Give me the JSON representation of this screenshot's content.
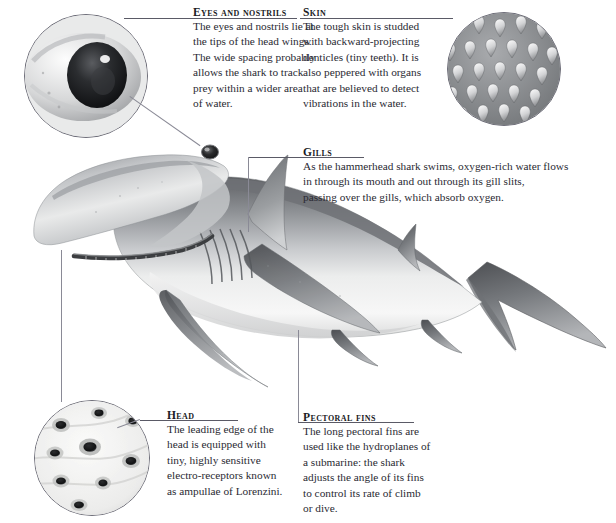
{
  "document": {
    "subject": "hammerhead-shark-anatomy",
    "background_color": "#ffffff",
    "text_color": "#2a2a33",
    "rule_color": "#5a5a66"
  },
  "callouts": [
    {
      "id": "eyes-and-nostrils",
      "heading": "Eyes and nostrils",
      "lines": [
        "The eyes and nostrils lie at",
        "the tips of the head wings.",
        "The wide spacing probably",
        "allows the shark to track",
        "prey within a wider area",
        "of water."
      ]
    },
    {
      "id": "skin",
      "heading": "Skin",
      "lines": [
        "The tough skin is studded",
        "with backward-projecting",
        "denticles (tiny teeth). It is",
        "also peppered with organs",
        "that are believed to detect",
        "vibrations in the water."
      ]
    },
    {
      "id": "gills",
      "heading": "Gills",
      "lines": [
        "As the hammerhead shark swims, oxygen-rich water flows",
        "in through its mouth and out through its gill slits,",
        "passing over the gills, which absorb oxygen."
      ]
    },
    {
      "id": "head",
      "heading": "Head",
      "lines": [
        "The leading edge of the",
        "head is equipped with",
        "tiny, highly sensitive",
        "electro-receptors known",
        "as ampullae of Lorenzini."
      ]
    },
    {
      "id": "pectoral-fins",
      "heading": "Pectoral fins",
      "lines": [
        "The long pectoral fins are",
        "used like the hydroplanes of",
        "a submarine: the shark",
        "adjusts the angle of its fins",
        "to control its rate of climb",
        "or dive."
      ]
    }
  ],
  "insets": [
    {
      "id": "eye-detail",
      "label": "shark-eye-closeup"
    },
    {
      "id": "skin-detail",
      "label": "dermal-denticles-closeup"
    },
    {
      "id": "ampullae-detail",
      "label": "ampullae-of-lorenzini-closeup"
    }
  ],
  "illustration": {
    "id": "hammerhead-shark",
    "label": "hammerhead shark side view"
  }
}
